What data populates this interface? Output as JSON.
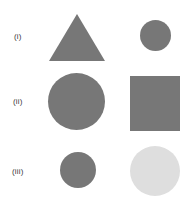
{
  "figure": {
    "width": 186,
    "height": 216,
    "background_color": "#ffffff"
  },
  "palette": {
    "shape_gray": "#777777",
    "shape_light_gray": "#dedede",
    "label_text": "#3b3b3b",
    "background": "#ffffff"
  },
  "rows": [
    {
      "label": "(i)",
      "label_x": 14,
      "label_y": 33,
      "shapes": [
        {
          "name": "triangle",
          "kind": "triangle",
          "color": "#777777",
          "x": 49,
          "y": 14,
          "width": 56,
          "height": 47
        },
        {
          "name": "small-circle",
          "kind": "circle",
          "color": "#777777",
          "x": 140,
          "y": 20,
          "width": 31,
          "height": 31
        }
      ]
    },
    {
      "label": "(ii)",
      "label_x": 13,
      "label_y": 98,
      "shapes": [
        {
          "name": "large-circle",
          "kind": "circle",
          "color": "#777777",
          "x": 48,
          "y": 73,
          "width": 57,
          "height": 57
        },
        {
          "name": "square",
          "kind": "square",
          "color": "#777777",
          "x": 130,
          "y": 76,
          "width": 50,
          "height": 55
        }
      ]
    },
    {
      "label": "(iii)",
      "label_x": 12,
      "label_y": 168,
      "shapes": [
        {
          "name": "small-circle",
          "kind": "circle",
          "color": "#777777",
          "x": 60,
          "y": 152,
          "width": 36,
          "height": 36
        },
        {
          "name": "large-light-circle",
          "kind": "circle",
          "color": "#dedede",
          "x": 130,
          "y": 146,
          "width": 50,
          "height": 50
        }
      ]
    }
  ]
}
